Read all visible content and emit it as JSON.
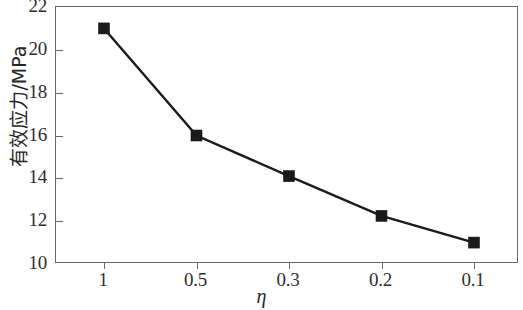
{
  "chart_data": {
    "type": "line",
    "title": "",
    "subtitle": "",
    "xlabel": "η",
    "ylabel": "有效应力/MPa",
    "categories": [
      "1",
      "0.5",
      "0.3",
      "0.2",
      "0.1"
    ],
    "x": [
      1,
      0.5,
      0.3,
      0.2,
      0.1
    ],
    "values": [
      21.0,
      16.0,
      14.1,
      12.25,
      11.0
    ],
    "series": [
      {
        "name": "有效应力",
        "values": [
          21.0,
          16.0,
          14.1,
          12.25,
          11.0
        ],
        "marker": "filled-square",
        "color": "#1a1a1a"
      }
    ],
    "ylim": [
      10,
      22
    ],
    "yticks": [
      10,
      12,
      14,
      16,
      18,
      20,
      22
    ],
    "ytick_labels": [
      "10",
      "12",
      "14",
      "16",
      "18",
      "20",
      "22"
    ],
    "xtick_labels": [
      "1",
      "0.5",
      "0.3",
      "0.2",
      "0.1"
    ],
    "xlim_categorical": true,
    "grid": false,
    "legend": false,
    "legend_position": "none",
    "frame": "box",
    "tick_direction": "in-left-out-bottom",
    "colors": {
      "line": "#1a1a1a",
      "marker": "#1a1a1a",
      "axis": "#6a6a6a",
      "text": "#2e2e2e",
      "background": "#ffffff"
    }
  },
  "axes": {
    "y_title": "有效应力/MPa",
    "x_title": "η"
  }
}
